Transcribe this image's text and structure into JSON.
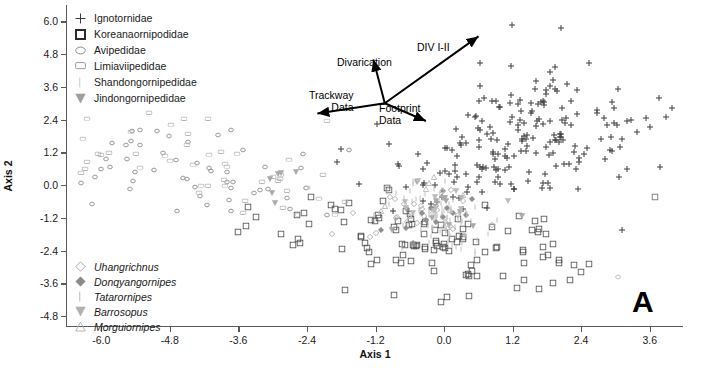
{
  "chart_data": {
    "type": "scatter",
    "title": "",
    "panel_label": "A",
    "xlabel": "Axis 1",
    "ylabel": "Axis 2",
    "xlim": [
      -6.6,
      4.2
    ],
    "ylim": [
      -5.2,
      6.6
    ],
    "xticks": [
      "-6.0",
      "-4.8",
      "-3.6",
      "-2.4",
      "-1.2",
      "0.0",
      "1.2",
      "2.4",
      "3.6"
    ],
    "xtick_values": [
      -6.0,
      -4.8,
      -3.6,
      -2.4,
      -1.2,
      0.0,
      1.2,
      2.4,
      3.6
    ],
    "yticks": [
      "6.0",
      "4.8",
      "3.6",
      "2.4",
      "1.2",
      "0.0",
      "-1.2",
      "-2.4",
      "-3.6",
      "-4.8"
    ],
    "ytick_values": [
      6.0,
      4.8,
      3.6,
      2.4,
      1.2,
      0.0,
      -1.2,
      -2.4,
      -3.6,
      -4.8
    ],
    "grid": false,
    "legend_position": "upper-left and lower-left inside axes",
    "series": [
      {
        "name": "Ignotornidae",
        "marker": "plus",
        "color": "#3c3c3c",
        "size": 7,
        "n": 210,
        "clusters": [
          {
            "cx": 1.75,
            "cy": 2.35,
            "sx": 0.85,
            "sy": 1.0,
            "n": 95,
            "seed": 11
          },
          {
            "cx": 0.85,
            "cy": 1.05,
            "sx": 0.7,
            "sy": 0.75,
            "n": 55,
            "seed": 23
          },
          {
            "cx": 0.1,
            "cy": 0.05,
            "sx": 0.65,
            "sy": 0.6,
            "n": 34,
            "seed": 37
          },
          {
            "cx": 2.6,
            "cy": 1.3,
            "sx": 0.75,
            "sy": 1.2,
            "n": 26,
            "seed": 53
          }
        ]
      },
      {
        "name": "Koreanaornipodidae",
        "marker": "square-open",
        "color": "#4a4a4a",
        "size": 7,
        "n": 120,
        "clusters": [
          {
            "cx": -0.55,
            "cy": -1.85,
            "sx": 1.0,
            "sy": 0.7,
            "n": 52,
            "seed": 71
          },
          {
            "cx": 0.75,
            "cy": -2.45,
            "sx": 0.95,
            "sy": 0.8,
            "n": 40,
            "seed": 89
          },
          {
            "cx": -1.55,
            "cy": -1.15,
            "sx": 0.7,
            "sy": 0.6,
            "n": 20,
            "seed": 101
          },
          {
            "cx": 1.95,
            "cy": -3.1,
            "sx": 0.55,
            "sy": 0.55,
            "n": 8,
            "seed": 113
          }
        ]
      },
      {
        "name": "Avipedidae",
        "marker": "ellipse-open",
        "color": "#9a9a9a",
        "size": 6,
        "n": 52,
        "clusters": [
          {
            "cx": -4.55,
            "cy": 0.95,
            "sx": 0.95,
            "sy": 0.85,
            "n": 26,
            "seed": 131
          },
          {
            "cx": -3.25,
            "cy": 0.15,
            "sx": 0.85,
            "sy": 0.6,
            "n": 16,
            "seed": 149
          },
          {
            "cx": -5.55,
            "cy": 1.6,
            "sx": 0.5,
            "sy": 0.7,
            "n": 10,
            "seed": 163
          }
        ]
      },
      {
        "name": "Limiaviipedidae",
        "marker": "rect-open",
        "color": "#b4b4b4",
        "size": 7,
        "n": 46,
        "clusters": [
          {
            "cx": -4.95,
            "cy": 1.25,
            "sx": 1.05,
            "sy": 0.9,
            "n": 24,
            "seed": 181
          },
          {
            "cx": -3.4,
            "cy": 0.35,
            "sx": 0.9,
            "sy": 0.7,
            "n": 14,
            "seed": 197
          },
          {
            "cx": -2.3,
            "cy": -0.45,
            "sx": 0.6,
            "sy": 0.45,
            "n": 8,
            "seed": 211
          }
        ]
      },
      {
        "name": "Shandongornipedidae",
        "marker": "vbar",
        "color": "#bdbdbd",
        "size": 6,
        "n": 70,
        "clusters": [
          {
            "cx": 0.05,
            "cy": -1.35,
            "sx": 0.3,
            "sy": 0.55,
            "n": 46,
            "seed": 229
          },
          {
            "cx": -0.35,
            "cy": -0.55,
            "sx": 0.35,
            "sy": 0.4,
            "n": 24,
            "seed": 241
          }
        ]
      },
      {
        "name": "Jindongornipedidae",
        "marker": "triangle-down",
        "color": "#aaaaaa",
        "size": 7,
        "n": 18,
        "clusters": [
          {
            "cx": -0.15,
            "cy": -0.95,
            "sx": 0.55,
            "sy": 0.55,
            "n": 12,
            "seed": 257
          },
          {
            "cx": -2.95,
            "cy": 0.05,
            "sx": 0.35,
            "sy": 0.3,
            "n": 6,
            "seed": 269
          }
        ]
      },
      {
        "name": "Uhangrichnus",
        "marker": "diamond-open",
        "color": "#b0b0b0",
        "size": 7,
        "n": 24,
        "clusters": [
          {
            "cx": -0.45,
            "cy": -1.05,
            "sx": 0.45,
            "sy": 0.45,
            "n": 24,
            "seed": 281
          }
        ]
      },
      {
        "name": "Donqyangornipes",
        "marker": "diamond-filled",
        "color": "#8f8f8f",
        "size": 7,
        "n": 14,
        "clusters": [
          {
            "cx": -0.25,
            "cy": -1.25,
            "sx": 0.4,
            "sy": 0.4,
            "n": 14,
            "seed": 293
          }
        ]
      },
      {
        "name": "Tatarornipes",
        "marker": "vbar",
        "color": "#c4c4c4",
        "size": 6,
        "n": 20,
        "clusters": [
          {
            "cx": 0.15,
            "cy": -1.55,
            "sx": 0.3,
            "sy": 0.5,
            "n": 20,
            "seed": 307
          }
        ]
      },
      {
        "name": "Barrosopus",
        "marker": "triangle-down",
        "color": "#bcbcbc",
        "size": 7,
        "n": 10,
        "clusters": [
          {
            "cx": 0.0,
            "cy": -0.75,
            "sx": 0.4,
            "sy": 0.4,
            "n": 10,
            "seed": 317
          }
        ]
      },
      {
        "name": "Morguiornipes",
        "marker": "triangle-up-open",
        "color": "#c0c0c0",
        "size": 7,
        "n": 10,
        "clusters": [
          {
            "cx": -0.6,
            "cy": -0.35,
            "sx": 0.4,
            "sy": 0.4,
            "n": 10,
            "seed": 331
          }
        ]
      }
    ],
    "outliers": [
      {
        "x": 3.7,
        "y": -0.45,
        "marker": "square-open",
        "color": "#6a6a6a",
        "size": 7
      },
      {
        "x": -6.25,
        "y": 2.45,
        "marker": "rect-open",
        "color": "#b4b4b4",
        "size": 7
      },
      {
        "x": -6.05,
        "y": 1.15,
        "marker": "rect-open",
        "color": "#b4b4b4",
        "size": 7
      },
      {
        "x": 3.05,
        "y": -3.35,
        "marker": "circle-open",
        "color": "#c0c0c0",
        "size": 6
      },
      {
        "x": -2.05,
        "y": 2.35,
        "marker": "rect-open",
        "color": "#bcbcbc",
        "size": 7
      }
    ],
    "annotations": [
      {
        "id": "div",
        "text": "DIV I-II"
      },
      {
        "id": "divarication",
        "text": "Divarication"
      },
      {
        "id": "trackway",
        "text": "Trackway\nData"
      },
      {
        "id": "footprint",
        "text": "Footprint\nData"
      }
    ],
    "vectors": [
      {
        "name": "DIV I-II",
        "from_x": -1.02,
        "from_y": 3.0,
        "to_x": 0.62,
        "to_y": 5.45
      },
      {
        "name": "Divarication",
        "from_x": -1.02,
        "from_y": 3.0,
        "to_x": -1.22,
        "to_y": 4.6
      },
      {
        "name": "Trackway Data",
        "from_x": -1.02,
        "from_y": 3.0,
        "to_x": -2.2,
        "to_y": 2.62
      },
      {
        "name": "Footprint Data",
        "from_x": -1.02,
        "from_y": 3.0,
        "to_x": -0.3,
        "to_y": 2.35
      }
    ]
  },
  "legend_families": {
    "title": "",
    "items": [
      {
        "label": "Ignotornidae",
        "marker": "plus",
        "color": "#3c3c3c"
      },
      {
        "label": "Koreanaornipodidae",
        "marker": "square-open-bold",
        "color": "#2b2b2b"
      },
      {
        "label": "Avipedidae",
        "marker": "ellipse-open",
        "color": "#8c8c8c"
      },
      {
        "label": "Limiaviipedidae",
        "marker": "rect-open",
        "color": "#9a9a9a"
      },
      {
        "label": "Shandongornipedidae",
        "marker": "vbar",
        "color": "#c8c8c8"
      },
      {
        "label": "Jindongornipedidae",
        "marker": "triangle-down",
        "color": "#9e9e9e"
      }
    ]
  },
  "legend_ichnogenera": {
    "title": "",
    "items": [
      {
        "label": "Uhangrichnus",
        "marker": "diamond-open",
        "color": "#a8a8a8"
      },
      {
        "label": "Donqyangornipes",
        "marker": "diamond-filled",
        "color": "#8a8a8a"
      },
      {
        "label": "Tatarornipes",
        "marker": "vbar",
        "color": "#bcbcbc"
      },
      {
        "label": "Barrosopus",
        "marker": "triangle-down",
        "color": "#b0b0b0"
      },
      {
        "label": "Morguiornipes",
        "marker": "triangle-up-open",
        "color": "#b4b4b4"
      }
    ]
  },
  "colors": {
    "axis": "#5a5a5a",
    "text": "#1a1a1a",
    "background": "#ffffff",
    "annotation": "#000000"
  }
}
